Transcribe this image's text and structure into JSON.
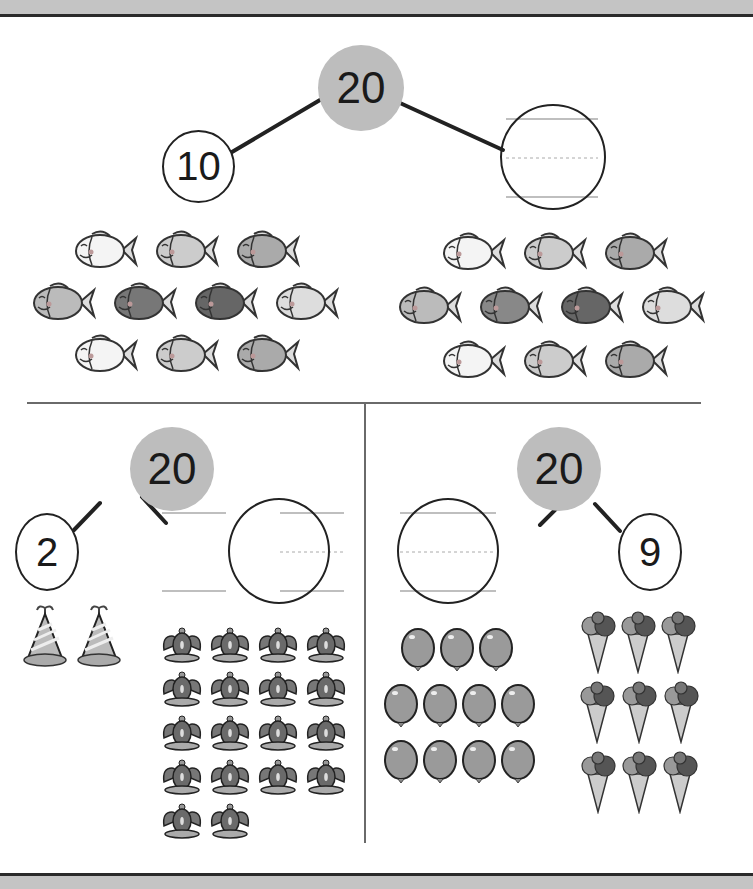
{
  "worksheet": {
    "type": "number-bond-worksheet",
    "colors": {
      "whole_fill": "#bdbdbd",
      "line": "#222222",
      "bar": "#c4c4c4"
    },
    "bonds": [
      {
        "id": "top",
        "whole": "20",
        "left_part": "10",
        "right_part": "",
        "groups": [
          {
            "item": "fish",
            "count": 10,
            "rows": [
              3,
              4,
              3
            ],
            "side": "left"
          },
          {
            "item": "fish",
            "count": 10,
            "rows": [
              3,
              4,
              3
            ],
            "side": "right"
          }
        ]
      },
      {
        "id": "bottom-left",
        "whole": "20",
        "left_part": "2",
        "right_part": "",
        "groups": [
          {
            "item": "party-hat",
            "count": 2,
            "rows": [
              2
            ],
            "side": "left"
          },
          {
            "item": "crown",
            "count": 18,
            "rows": [
              4,
              4,
              4,
              4,
              2
            ],
            "side": "right"
          }
        ]
      },
      {
        "id": "bottom-right",
        "whole": "20",
        "left_part": "",
        "right_part": "9",
        "groups": [
          {
            "item": "balloon",
            "count": 11,
            "rows": [
              3,
              4,
              4
            ],
            "side": "left"
          },
          {
            "item": "ice-cream-cone",
            "count": 9,
            "rows": [
              3,
              3,
              3
            ],
            "side": "right"
          }
        ]
      }
    ]
  }
}
